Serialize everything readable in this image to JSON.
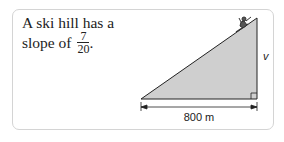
{
  "problem": {
    "line1": "A ski hill has a",
    "line2_prefix": "slope of ",
    "slope_numerator": "7",
    "slope_denominator": "20",
    "line2_suffix": "."
  },
  "figure": {
    "vertical_label": "v",
    "horizontal_label": "800 m",
    "icons": [
      "skier-icon",
      "right-angle-marker-icon"
    ],
    "colors": {
      "fill": "#cfcfcf",
      "stroke": "#222222"
    }
  }
}
